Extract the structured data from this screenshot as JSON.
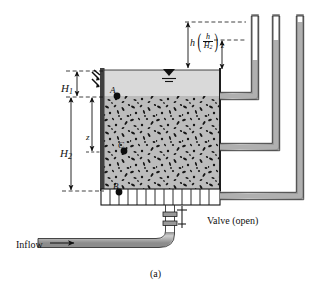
{
  "figure": {
    "caption": "(a)",
    "title_desc": "filter-bed-tank-with-manometers"
  },
  "labels": {
    "H1": "H",
    "H1_sub": "1",
    "H2": "H",
    "H2_sub": "2",
    "z": "z",
    "h": "h",
    "point_A": "A",
    "point_C": "C",
    "point_B": "B",
    "valve": "Valve (open)",
    "inflow": "Inflow"
  },
  "fraction": {
    "numerator": "h",
    "denominator": "H",
    "denominator_sub": "2",
    "multiplier": "z",
    "open_paren": "(",
    "close_paren": ")"
  },
  "colors": {
    "media_fill": "#b9b9b9",
    "water_fill": "#d6d6d6",
    "tube_fill": "#b4b4b4",
    "tube_empty": "#ffffff",
    "line": "#1a1a1a",
    "grate_fill": "#ffffff",
    "wall": "#4a4a4a"
  },
  "elements": {
    "water_surface_symbol": "water-level-triangle",
    "manometer_count": 3,
    "grate_cells": 13,
    "media_label": "granular-filter-media"
  }
}
